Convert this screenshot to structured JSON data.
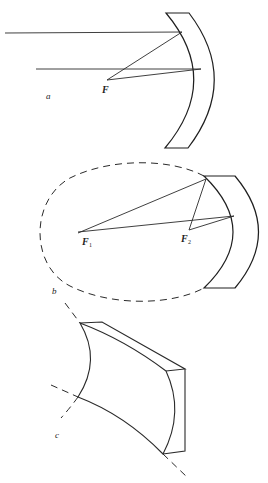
{
  "figure": {
    "panels": [
      {
        "id": "a",
        "label": "a",
        "subject": "Parabolic mirror cross-section focusing parallel rays",
        "focus_label": "F"
      },
      {
        "id": "b",
        "label": "b",
        "subject": "Elliptical mirror cross-section reflecting rays from one focus to the other",
        "focus_labels": [
          {
            "main": "F",
            "sub": "1"
          },
          {
            "main": "F",
            "sub": "2"
          }
        ]
      },
      {
        "id": "c",
        "label": "c",
        "subject": "Perspective view of a cylindrically curved mirror block"
      }
    ]
  },
  "colors": {
    "line": "#2a2a2a",
    "background": "#ffffff"
  }
}
